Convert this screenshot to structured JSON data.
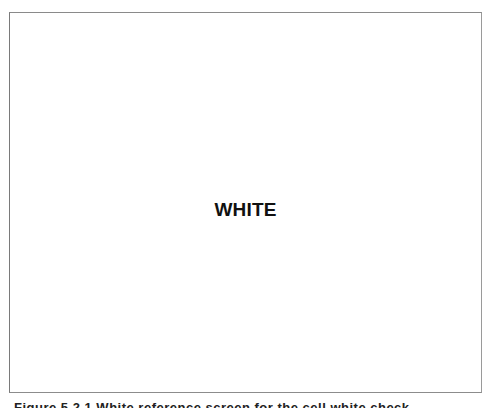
{
  "panel": {
    "label": "WHITE",
    "background_color": "#ffffff",
    "border_color": "#8a8a8a"
  },
  "caption": {
    "text": "Figure 5.2.1 White reference screen for the cell white check"
  }
}
